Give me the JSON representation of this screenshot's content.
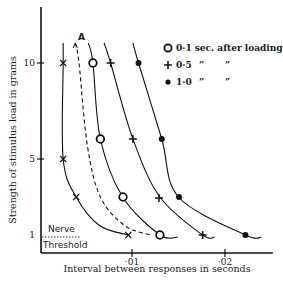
{
  "chart_data": {
    "type": "line",
    "title": "",
    "xlabel": "Interval between responses in seconds",
    "ylabel": "Strength of stimulus load in grams",
    "xlim": [
      0,
      0.025
    ],
    "y_scale": "log-like",
    "y_ticks": [
      {
        "value": 10,
        "label": "10"
      },
      {
        "value": 5,
        "label": "5"
      },
      {
        "value": 1,
        "label": "1"
      }
    ],
    "x_ticks": [
      {
        "value": 0.01,
        "label": "·01"
      },
      {
        "value": 0.02,
        "label": "·02"
      }
    ],
    "grid": false,
    "legend_position": "top-right",
    "legend": [
      {
        "marker": "circle-open",
        "label": "0·1 sec. after loading"
      },
      {
        "marker": "plus",
        "label": "0·5",
        "ditto": [
          "”",
          "”"
        ]
      },
      {
        "marker": "dot",
        "label": "1·0",
        "ditto": [
          "”",
          "”"
        ]
      }
    ],
    "series": [
      {
        "name": "Nerve threshold (x)",
        "marker": "cross",
        "line": "solid",
        "points": [
          [
            0.0026,
            12.5
          ],
          [
            0.0026,
            10
          ],
          [
            0.0026,
            5
          ],
          [
            0.004,
            3
          ],
          [
            0.0065,
            1.5
          ],
          [
            0.0096,
            1
          ]
        ]
      },
      {
        "name": "A",
        "marker": "none",
        "line": "dashed",
        "points": [
          [
            0.0039,
            13.5
          ],
          [
            0.0043,
            10
          ],
          [
            0.0052,
            6
          ],
          [
            0.0066,
            3
          ],
          [
            0.0092,
            1.5
          ],
          [
            0.012,
            1
          ]
        ]
      },
      {
        "name": "0·1 sec. after loading",
        "marker": "circle-open",
        "line": "solid",
        "points": [
          [
            0.0053,
            13.5
          ],
          [
            0.0058,
            10
          ],
          [
            0.0066,
            6.5
          ],
          [
            0.009,
            3
          ],
          [
            0.013,
            1
          ]
        ]
      },
      {
        "name": "0·5 sec. after loading",
        "marker": "plus",
        "line": "solid",
        "points": [
          [
            0.007,
            13.5
          ],
          [
            0.0077,
            10
          ],
          [
            0.0101,
            6.5
          ],
          [
            0.013,
            3
          ],
          [
            0.0176,
            1
          ]
        ]
      },
      {
        "name": "1·0 sec. after loading",
        "marker": "dot",
        "line": "solid",
        "points": [
          [
            0.0101,
            13.5
          ],
          [
            0.0107,
            10
          ],
          [
            0.0132,
            6.5
          ],
          [
            0.015,
            3
          ],
          [
            0.0222,
            1
          ]
        ]
      }
    ],
    "annotations": [
      {
        "text": "A",
        "near_series": "A"
      },
      {
        "text": "Nerve",
        "line2": "Threshold"
      }
    ]
  }
}
